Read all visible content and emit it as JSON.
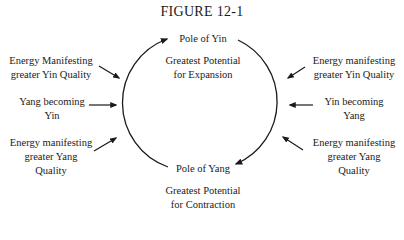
{
  "figure": {
    "title": "FIGURE 12-1",
    "top_pole": {
      "label": "Pole of Yin",
      "description_line1": "Greatest Potential",
      "description_line2": "for Expansion"
    },
    "bottom_pole": {
      "label": "Pole of Yang",
      "description_line1": "Greatest Potential",
      "description_line2": "for Contraction"
    },
    "left": [
      {
        "line1": "Energy Manifesting",
        "line2": "greater Yin Quality"
      },
      {
        "line1": "Yang becoming",
        "line2": "Yin"
      },
      {
        "line1": "Energy manifesting",
        "line2": "greater Yang",
        "line3": "Quality"
      }
    ],
    "right": [
      {
        "line1": "Energy manifesting",
        "line2": "greater Yin Quality"
      },
      {
        "line1": "Yin becoming",
        "line2": "Yang"
      },
      {
        "line1": "Energy manifesting",
        "line2": "greater Yang",
        "line3": "Quality"
      }
    ],
    "colors": {
      "ink": "#1a1a1a",
      "background": "#ffffff"
    }
  }
}
